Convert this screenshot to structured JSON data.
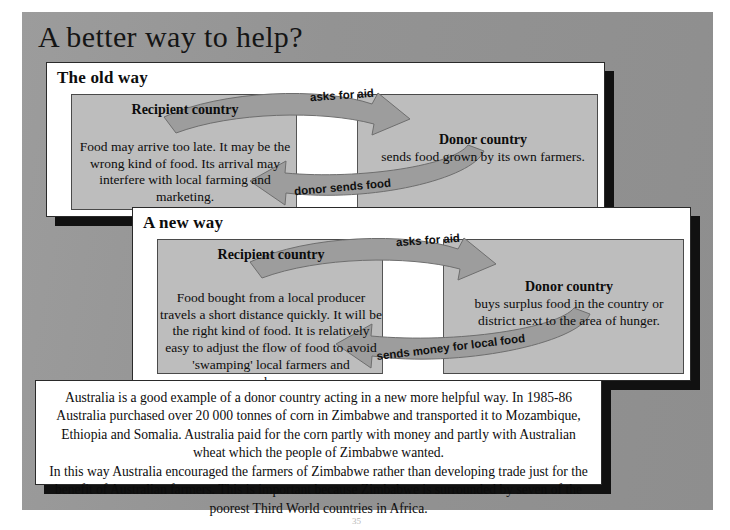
{
  "document": {
    "title": "A better way to help?",
    "page_number": "35"
  },
  "panels": [
    {
      "heading": "The old way",
      "recipient": {
        "name": "Recipient country",
        "description": "Food may arrive too late.  It may be the wrong kind of food. Its arrival may interfere with local farming and marketing."
      },
      "donor": {
        "name": "Donor country",
        "description": "sends food grown by its own farmers."
      },
      "arrows": {
        "top_label": "asks for aid",
        "bottom_label": "donor sends food"
      }
    },
    {
      "heading": "A new way",
      "recipient": {
        "name": "Recipient country",
        "description": "Food bought from a local producer travels a short distance quickly. It will be the right kind of food.  It is relatively easy to adjust the flow of food to avoid 'swamping' local farmers and warehouses."
      },
      "donor": {
        "name": "Donor country",
        "description": "buys surplus food in the country or district next to the area of hunger."
      },
      "arrows": {
        "top_label": "asks for aid",
        "bottom_label": "sends money for local food"
      }
    }
  ],
  "summary": {
    "paragraph_1": "Australia is a good example of a donor country acting in a new more helpful way.  In 1985-86 Australia purchased over 20 000 tonnes of corn in Zimbabwe and transported it to Mozambique, Ethiopia and Somalia.  Australia paid for the corn partly with money and partly with Australian wheat which the people of Zimbabwe wanted.",
    "paragraph_2": "In this way Australia encouraged the farmers of Zimbabwe rather than developing trade just for the benefit of Australian farmers.  This is  important because Zimbabwe is surrounded by seven of the poorest Third World countries in Africa."
  },
  "colors": {
    "page_background": "#939393",
    "panel_background": "#ffffff",
    "diagram_box": "#bdbdbd",
    "arrow_fill": "#9d9d9d",
    "shadow": "#111111"
  }
}
